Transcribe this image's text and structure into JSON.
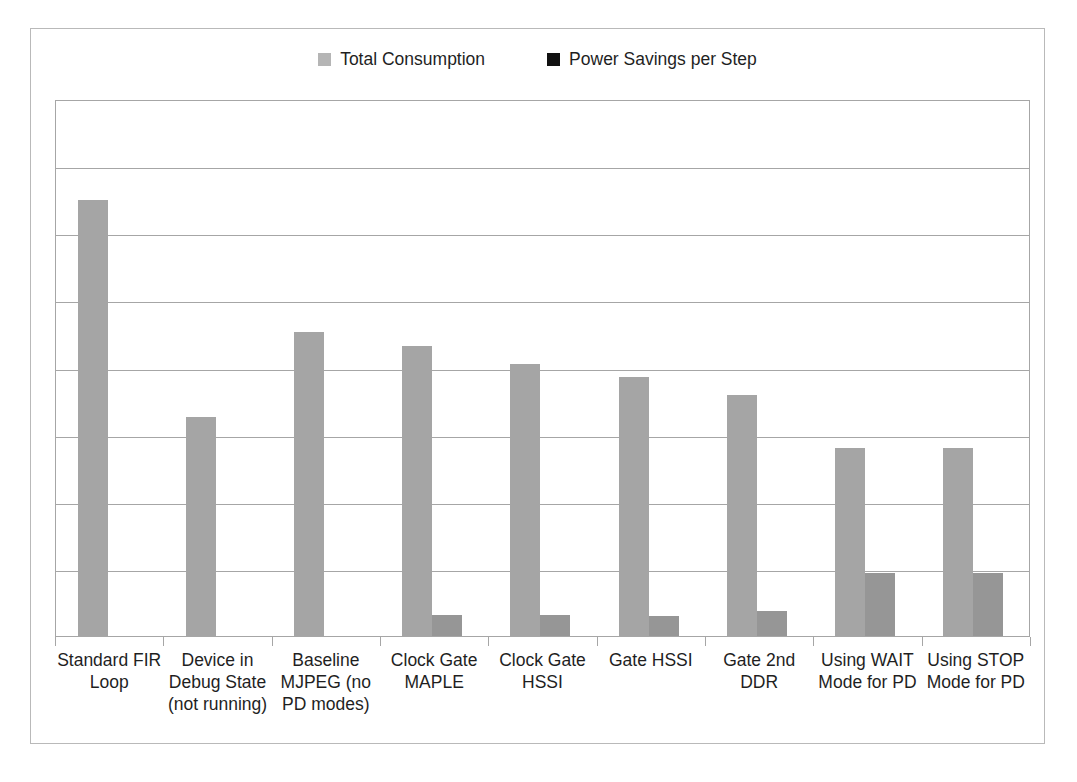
{
  "chart_data": {
    "type": "bar",
    "title": "",
    "subtitle": "",
    "xlabel": "",
    "ylabel": "",
    "ylim": [
      0,
      700
    ],
    "grid": true,
    "gridline_count": 7,
    "y_tick_labels": [],
    "legend_position": "top-center",
    "categories": [
      "Standard FIR Loop",
      "Device in Debug State (not running)",
      "Baseline MJPEG (no PD modes)",
      "Clock Gate MAPLE",
      "Clock Gate HSSI",
      "Gate HSSI",
      "Gate 2nd DDR",
      "Using WAIT Mode for PD",
      "Using STOP Mode for PD"
    ],
    "series": [
      {
        "name": "Total Consumption",
        "color": "#a5a5a5",
        "values": [
          568,
          286,
          396,
          378,
          355,
          338,
          314,
          245,
          245
        ]
      },
      {
        "name": "Power Savings per Step",
        "color": "#969696",
        "values": [
          0,
          0,
          0,
          28,
          28,
          26,
          32,
          82,
          82
        ]
      }
    ]
  },
  "legend": {
    "items": [
      {
        "label": "Total Consumption",
        "swatch_color": "#b5b5b5",
        "icon": "square-swatch-icon"
      },
      {
        "label": "Power Savings per Step",
        "swatch_color": "#111111",
        "icon": "square-swatch-icon"
      }
    ]
  },
  "axis_labels": [
    {
      "line1": "Standard FIR",
      "line2": "Loop",
      "line3": ""
    },
    {
      "line1": "Device in",
      "line2": "Debug State",
      "line3": "(not running)"
    },
    {
      "line1": "Baseline",
      "line2": "MJPEG (no",
      "line3": "PD modes)"
    },
    {
      "line1": "Clock Gate",
      "line2": "MAPLE",
      "line3": ""
    },
    {
      "line1": "Clock Gate",
      "line2": "HSSI",
      "line3": ""
    },
    {
      "line1": "Gate HSSI",
      "line2": "",
      "line3": ""
    },
    {
      "line1": "Gate 2nd",
      "line2": "DDR",
      "line3": ""
    },
    {
      "line1": "Using WAIT",
      "line2": "Mode for PD",
      "line3": ""
    },
    {
      "line1": "Using STOP",
      "line2": "Mode for PD",
      "line3": ""
    }
  ],
  "colors": {
    "frame": "#b9b9b9",
    "plot_border": "#a6a6a6",
    "gridline": "#a6a6a6",
    "background": "#ffffff",
    "text": "#1f1f1f"
  }
}
